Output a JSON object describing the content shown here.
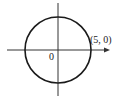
{
  "diagram": {
    "type": "circle-on-axes",
    "origin_label": "0",
    "point_label": "(5, 0)",
    "circle": {
      "center": [
        0,
        0
      ],
      "radius": 5
    },
    "colors": {
      "stroke": "#1a1a1a",
      "background": "#ffffff"
    }
  }
}
